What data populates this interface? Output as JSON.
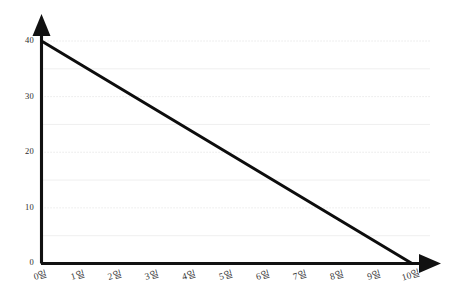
{
  "chart_data": {
    "type": "line",
    "title": "",
    "subtitle": "",
    "xlabel": "",
    "ylabel": "",
    "x": [
      0,
      1,
      2,
      3,
      4,
      5,
      6,
      7,
      8,
      9,
      10
    ],
    "categories": [
      "0일",
      "1일",
      "2일",
      "3일",
      "4일",
      "5일",
      "6일",
      "7일",
      "8일",
      "9일",
      "10일"
    ],
    "values": [
      40,
      36,
      32,
      28,
      24,
      20,
      16,
      12,
      8,
      4,
      0
    ],
    "series": [
      {
        "name": "",
        "values": [
          40,
          36,
          32,
          28,
          24,
          20,
          16,
          12,
          8,
          4,
          0
        ]
      }
    ],
    "xlim": [
      0,
      10
    ],
    "ylim": [
      0,
      40
    ],
    "y_ticks": [
      0,
      10,
      20,
      30,
      40
    ],
    "y_tick_labels": [
      "0",
      "10",
      "20",
      "30",
      "40"
    ],
    "x_ticks": [
      0,
      1,
      2,
      3,
      4,
      5,
      6,
      7,
      8,
      9,
      10
    ],
    "x_tick_labels": [
      "0일",
      "1일",
      "2일",
      "3일",
      "4일",
      "5일",
      "6일",
      "7일",
      "8일",
      "9일",
      "10일"
    ],
    "grid": true,
    "grid_major_values": [
      40,
      30,
      20,
      10
    ],
    "grid_minor_values": [
      35,
      25,
      15,
      5
    ],
    "legend": [],
    "legend_position": "none",
    "annotations": [],
    "line_color": "#0d0d0d",
    "grid_major_color": "#d9d9d9",
    "grid_minor_color": "#ededed",
    "axis_color": "#111111",
    "background_color": "#ffffff",
    "axis_arrow_y": "up",
    "axis_arrow_x": "right"
  },
  "axis": {
    "y_labels": [
      "40",
      "30",
      "20",
      "10",
      "0"
    ],
    "x_labels": [
      "0일",
      "1일",
      "2일",
      "3일",
      "4일",
      "5일",
      "6일",
      "7일",
      "8일",
      "9일",
      "10일"
    ]
  }
}
